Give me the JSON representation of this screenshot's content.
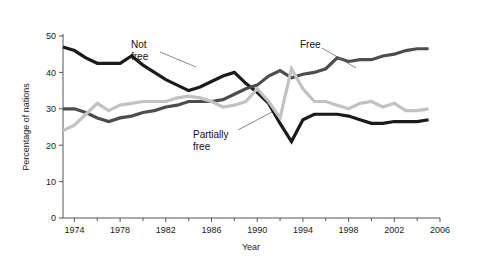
{
  "chart_data": {
    "type": "line",
    "title": "",
    "xlabel": "Year",
    "ylabel": "Percentage of nations",
    "xlim": [
      1973,
      2006
    ],
    "ylim": [
      0,
      50
    ],
    "grid": false,
    "legend_position": "inline-annotations",
    "y_ticks": [
      0,
      10,
      20,
      30,
      40,
      50
    ],
    "y_tick_labels": [
      "0",
      "10",
      "20",
      "30",
      "40",
      "50"
    ],
    "x_ticks": [
      1974,
      1978,
      1982,
      1986,
      1990,
      1994,
      1998,
      2002,
      2006
    ],
    "x_tick_labels": [
      "1974",
      "1978",
      "1982",
      "1986",
      "1990",
      "1994",
      "1998",
      "2002",
      "2006"
    ],
    "x_minor_ticks": [
      1976,
      1980,
      1984,
      1988,
      1992,
      1996,
      2000,
      2004
    ],
    "x": [
      1973,
      1974,
      1975,
      1976,
      1977,
      1978,
      1979,
      1980,
      1981,
      1982,
      1983,
      1984,
      1985,
      1986,
      1987,
      1988,
      1989,
      1990,
      1991,
      1992,
      1993,
      1994,
      1995,
      1996,
      1997,
      1998,
      1999,
      2000,
      2001,
      2002,
      2003,
      2004,
      2005
    ],
    "series": [
      {
        "name": "Not free",
        "color": "#1a1a1a",
        "values": [
          47.0,
          46.0,
          44.0,
          42.5,
          42.5,
          42.5,
          44.5,
          42.0,
          40.0,
          38.0,
          36.5,
          35.0,
          36.0,
          37.5,
          39.0,
          40.0,
          37.0,
          34.5,
          31.5,
          26.0,
          21.0,
          27.0,
          28.5,
          28.5,
          28.5,
          28.0,
          27.0,
          26.0,
          26.0,
          26.5,
          26.5,
          26.5,
          27.0
        ]
      },
      {
        "name": "Free",
        "color": "#4d4d4d",
        "values": [
          30.0,
          30.0,
          29.0,
          27.5,
          26.5,
          27.5,
          28.0,
          29.0,
          29.5,
          30.5,
          31.0,
          32.0,
          32.0,
          32.0,
          32.5,
          34.0,
          35.5,
          36.5,
          39.0,
          40.5,
          38.5,
          39.5,
          40.0,
          41.0,
          44.0,
          43.0,
          43.5,
          43.5,
          44.5,
          45.0,
          46.0,
          46.5,
          46.5
        ]
      },
      {
        "name": "Partially free",
        "color": "#c2c2c2",
        "values": [
          24.0,
          25.5,
          28.5,
          31.5,
          29.5,
          31.0,
          31.5,
          32.0,
          32.0,
          32.0,
          33.0,
          33.5,
          33.0,
          32.0,
          30.5,
          31.0,
          32.0,
          35.5,
          32.0,
          27.5,
          41.0,
          35.5,
          32.0,
          32.0,
          31.0,
          30.0,
          31.5,
          32.0,
          30.5,
          31.5,
          29.5,
          29.5,
          30.0
        ]
      }
    ],
    "annotations": [
      {
        "label_line1": "Not",
        "label_line2": "free",
        "x": 131,
        "y": 48
      },
      {
        "label_line1": "Free",
        "label_line2": "",
        "x": 300,
        "y": 48
      },
      {
        "label_line1": "Partially",
        "label_line2": "free",
        "x": 193,
        "y": 138
      }
    ]
  }
}
